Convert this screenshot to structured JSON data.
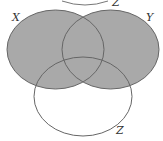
{
  "diagram": {
    "type": "venn",
    "sets": [
      {
        "name": "X",
        "label": "X"
      },
      {
        "name": "Y",
        "label": "Y"
      },
      {
        "name": "Z",
        "label": "Z"
      }
    ],
    "top_partial_label": "Z",
    "shaded_region": "X ∪ Y",
    "colors": {
      "shade": "#a9a9a9",
      "stroke": "#666666",
      "background": "#ffffff"
    }
  }
}
